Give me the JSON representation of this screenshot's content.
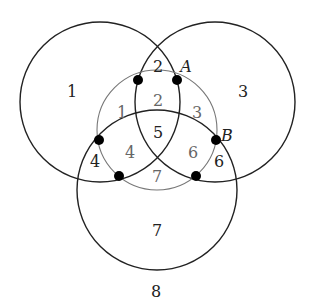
{
  "diagram": {
    "colors": {
      "outer_stroke": "#222222",
      "inner_stroke": "#777777",
      "dot": "#000000",
      "outer_label": "#222222",
      "inner_label": "#666666"
    },
    "circles": [
      {
        "id": "left",
        "cx": 100,
        "cy": 102,
        "r": 80,
        "style": "outer"
      },
      {
        "id": "right",
        "cx": 215,
        "cy": 102,
        "r": 80,
        "style": "outer"
      },
      {
        "id": "bottom",
        "cx": 157,
        "cy": 190,
        "r": 80,
        "style": "outer"
      },
      {
        "id": "inner",
        "cx": 157,
        "cy": 130,
        "r": 60,
        "style": "inner"
      }
    ],
    "dots": [
      {
        "x": 138,
        "y": 80
      },
      {
        "x": 177,
        "y": 80
      },
      {
        "x": 99,
        "y": 140
      },
      {
        "x": 216,
        "y": 140
      },
      {
        "x": 119,
        "y": 176
      },
      {
        "x": 196,
        "y": 176
      }
    ],
    "outer_region_labels": [
      {
        "text": "1",
        "x": 72,
        "y": 97
      },
      {
        "text": "2",
        "x": 158,
        "y": 72
      },
      {
        "text": "3",
        "x": 243,
        "y": 97
      },
      {
        "text": "5",
        "x": 158,
        "y": 138
      },
      {
        "text": "4",
        "x": 95,
        "y": 167
      },
      {
        "text": "6",
        "x": 219,
        "y": 167
      },
      {
        "text": "7",
        "x": 157,
        "y": 236
      },
      {
        "text": "8",
        "x": 156,
        "y": 297
      }
    ],
    "inner_region_labels": [
      {
        "text": "1",
        "x": 122,
        "y": 118
      },
      {
        "text": "2",
        "x": 158,
        "y": 106
      },
      {
        "text": "3",
        "x": 197,
        "y": 118
      },
      {
        "text": "4",
        "x": 130,
        "y": 158
      },
      {
        "text": "6",
        "x": 193,
        "y": 158
      },
      {
        "text": "7",
        "x": 157,
        "y": 182
      }
    ],
    "point_labels": [
      {
        "text": "A",
        "x": 186,
        "y": 72
      },
      {
        "text": "B",
        "x": 227,
        "y": 141
      }
    ]
  }
}
